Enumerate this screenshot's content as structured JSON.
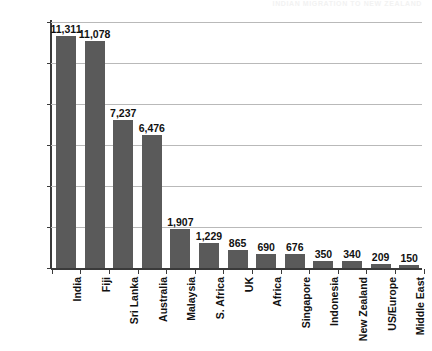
{
  "header": {
    "running_header_text": "INDIAN MIGRATION TO NEW ZEALAND"
  },
  "chart_data": {
    "type": "bar",
    "title": "",
    "subtitle": "",
    "xlabel": "",
    "ylabel": "",
    "ylim": [
      0,
      12000
    ],
    "ytick_values": [
      0,
      2000,
      4000,
      6000,
      8000,
      10000,
      12000
    ],
    "ytick_labels": [
      "0",
      "2,000",
      "4,000",
      "6,000",
      "8,000",
      "10,000",
      "12,000"
    ],
    "grid": true,
    "legend": false,
    "legend_position": "none",
    "bar_color": "#5a5a5a",
    "categories": [
      "India",
      "Fiji",
      "Sri Lanka",
      "Australia",
      "Malaysia",
      "S. Africa",
      "UK",
      "Africa",
      "Singapore",
      "Indonesia",
      "New Zealand",
      "US/Europe",
      "Middle East"
    ],
    "values": [
      11311,
      11078,
      7237,
      6476,
      1907,
      1229,
      865,
      690,
      676,
      350,
      340,
      209,
      150
    ],
    "value_labels": [
      "11,311",
      "11,078",
      "7,237",
      "6,476",
      "1,907",
      "1,229",
      "865",
      "690",
      "676",
      "350",
      "340",
      "209",
      "150"
    ]
  }
}
